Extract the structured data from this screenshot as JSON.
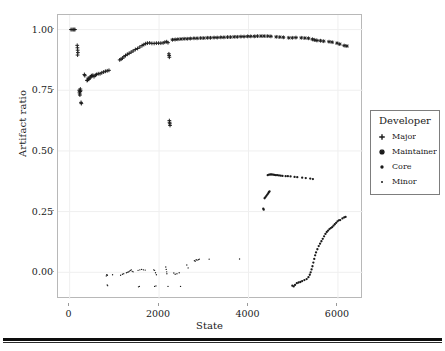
{
  "chart_data": {
    "type": "scatter",
    "title": "",
    "xlabel": "State",
    "ylabel": "Artifact ratio",
    "xlim": [
      -260,
      6560
    ],
    "ylim": [
      -0.11,
      1.06
    ],
    "xticks": [
      0,
      2000,
      4000,
      6000
    ],
    "xtick_labels": [
      "0",
      "2000",
      "4000",
      "6000"
    ],
    "yticks": [
      0.0,
      0.25,
      0.5,
      0.75,
      1.0
    ],
    "ytick_labels": [
      "0.00",
      "0.25",
      "0.50",
      "0.75",
      "1.00"
    ],
    "grid": true,
    "grid_color": "#efefef",
    "legend_position": "right",
    "marker_color": "#1a1a1a",
    "series": [
      {
        "name": "Major",
        "marker": "plus",
        "points": [
          [
            30,
            1.0
          ],
          [
            55,
            1.0
          ],
          [
            80,
            1.0
          ],
          [
            100,
            1.0
          ],
          [
            120,
            1.0
          ],
          [
            170,
            0.935
          ],
          [
            175,
            0.925
          ],
          [
            180,
            0.915
          ],
          [
            185,
            0.905
          ],
          [
            178,
            0.895
          ],
          [
            215,
            0.75
          ],
          [
            220,
            0.742
          ],
          [
            225,
            0.735
          ],
          [
            230,
            0.73
          ],
          [
            235,
            0.745
          ],
          [
            240,
            0.755
          ],
          [
            245,
            0.748
          ],
          [
            255,
            0.7
          ],
          [
            262,
            0.695
          ],
          [
            330,
            0.815
          ],
          [
            340,
            0.81
          ],
          [
            390,
            0.79
          ],
          [
            400,
            0.792
          ],
          [
            415,
            0.8
          ],
          [
            430,
            0.795
          ],
          [
            450,
            0.8
          ],
          [
            470,
            0.805
          ],
          [
            485,
            0.81
          ],
          [
            500,
            0.808
          ],
          [
            520,
            0.812
          ],
          [
            545,
            0.806
          ],
          [
            575,
            0.812
          ],
          [
            600,
            0.815
          ],
          [
            640,
            0.818
          ],
          [
            680,
            0.818
          ],
          [
            720,
            0.822
          ],
          [
            760,
            0.825
          ],
          [
            800,
            0.828
          ],
          [
            840,
            0.83
          ],
          [
            880,
            0.832
          ],
          [
            1120,
            0.875
          ],
          [
            1150,
            0.878
          ],
          [
            1180,
            0.882
          ],
          [
            1215,
            0.888
          ],
          [
            1250,
            0.893
          ],
          [
            1290,
            0.898
          ],
          [
            1330,
            0.902
          ],
          [
            1375,
            0.907
          ],
          [
            1420,
            0.912
          ],
          [
            1470,
            0.918
          ],
          [
            1520,
            0.922
          ],
          [
            1570,
            0.928
          ],
          [
            1620,
            0.934
          ],
          [
            1660,
            0.938
          ],
          [
            1700,
            0.942
          ],
          [
            1740,
            0.944
          ],
          [
            1790,
            0.945
          ],
          [
            1840,
            0.943
          ],
          [
            1890,
            0.943
          ],
          [
            1940,
            0.944
          ],
          [
            1990,
            0.944
          ],
          [
            2040,
            0.944
          ],
          [
            2090,
            0.945
          ],
          [
            2130,
            0.948
          ],
          [
            2170,
            0.95
          ],
          [
            2200,
            0.946
          ],
          [
            2220,
            0.9
          ],
          [
            2225,
            0.893
          ],
          [
            2230,
            0.886
          ],
          [
            2230,
            0.625
          ],
          [
            2235,
            0.618
          ],
          [
            2240,
            0.612
          ],
          [
            2245,
            0.605
          ]
        ]
      },
      {
        "name": "Maintainer",
        "marker": "asterisk",
        "points": [
          [
            2300,
            0.958
          ],
          [
            2360,
            0.959
          ],
          [
            2420,
            0.96
          ],
          [
            2490,
            0.961
          ],
          [
            2560,
            0.962
          ],
          [
            2630,
            0.962
          ],
          [
            2700,
            0.963
          ],
          [
            2780,
            0.964
          ],
          [
            2850,
            0.964
          ],
          [
            2930,
            0.965
          ],
          [
            3000,
            0.965
          ],
          [
            3080,
            0.966
          ],
          [
            3150,
            0.966
          ],
          [
            3230,
            0.967
          ],
          [
            3300,
            0.967
          ],
          [
            3380,
            0.968
          ],
          [
            3450,
            0.968
          ],
          [
            3530,
            0.969
          ],
          [
            3600,
            0.969
          ],
          [
            3680,
            0.97
          ],
          [
            3750,
            0.97
          ],
          [
            3830,
            0.971
          ],
          [
            3900,
            0.971
          ],
          [
            3980,
            0.972
          ],
          [
            4050,
            0.972
          ],
          [
            4130,
            0.972
          ],
          [
            4200,
            0.973
          ],
          [
            4280,
            0.973
          ],
          [
            4350,
            0.973
          ],
          [
            4430,
            0.973
          ],
          [
            4500,
            0.972
          ],
          [
            4620,
            0.97
          ],
          [
            4700,
            0.969
          ],
          [
            4780,
            0.968
          ],
          [
            4900,
            0.966
          ],
          [
            4980,
            0.966
          ],
          [
            5060,
            0.967
          ],
          [
            5180,
            0.966
          ],
          [
            5260,
            0.965
          ],
          [
            5340,
            0.964
          ],
          [
            5430,
            0.96
          ],
          [
            5480,
            0.957
          ],
          [
            5530,
            0.955
          ],
          [
            5610,
            0.954
          ],
          [
            5680,
            0.952
          ],
          [
            5800,
            0.95
          ],
          [
            5870,
            0.948
          ],
          [
            5980,
            0.944
          ],
          [
            6040,
            0.94
          ],
          [
            6140,
            0.934
          ],
          [
            6200,
            0.932
          ]
        ]
      },
      {
        "name": "Core",
        "marker": "dot",
        "points": [
          [
            4430,
            0.4
          ],
          [
            4460,
            0.402
          ],
          [
            4490,
            0.403
          ],
          [
            4520,
            0.403
          ],
          [
            4550,
            0.402
          ],
          [
            4580,
            0.401
          ],
          [
            4610,
            0.4
          ],
          [
            4640,
            0.4
          ],
          [
            4680,
            0.399
          ],
          [
            4720,
            0.398
          ],
          [
            4760,
            0.397
          ],
          [
            4830,
            0.396
          ],
          [
            4880,
            0.396
          ],
          [
            4940,
            0.395
          ],
          [
            5030,
            0.393
          ],
          [
            5090,
            0.392
          ],
          [
            5200,
            0.39
          ],
          [
            5280,
            0.388
          ],
          [
            5380,
            0.386
          ],
          [
            5440,
            0.384
          ],
          [
            4360,
            0.305
          ],
          [
            4380,
            0.31
          ],
          [
            4400,
            0.315
          ],
          [
            4420,
            0.32
          ],
          [
            4440,
            0.325
          ],
          [
            4455,
            0.33
          ],
          [
            4470,
            0.333
          ],
          [
            4330,
            0.262
          ],
          [
            4340,
            0.258
          ],
          [
            4980,
            -0.055
          ],
          [
            5010,
            -0.058
          ],
          [
            5040,
            -0.052
          ],
          [
            5080,
            -0.045
          ],
          [
            5120,
            -0.042
          ],
          [
            5160,
            -0.04
          ],
          [
            5200,
            -0.036
          ],
          [
            5250,
            -0.032
          ],
          [
            5300,
            -0.028
          ],
          [
            5340,
            -0.02
          ],
          [
            5370,
            -0.01
          ],
          [
            5390,
            0.0
          ],
          [
            5410,
            0.012
          ],
          [
            5430,
            0.025
          ],
          [
            5450,
            0.04
          ],
          [
            5470,
            0.055
          ],
          [
            5490,
            0.07
          ],
          [
            5510,
            0.082
          ],
          [
            5540,
            0.095
          ],
          [
            5570,
            0.108
          ],
          [
            5600,
            0.118
          ],
          [
            5630,
            0.128
          ],
          [
            5660,
            0.138
          ],
          [
            5690,
            0.148
          ],
          [
            5720,
            0.158
          ],
          [
            5750,
            0.166
          ],
          [
            5780,
            0.172
          ],
          [
            5810,
            0.178
          ],
          [
            5840,
            0.182
          ],
          [
            5870,
            0.186
          ],
          [
            5900,
            0.192
          ],
          [
            5930,
            0.198
          ],
          [
            5960,
            0.204
          ],
          [
            5990,
            0.21
          ],
          [
            6020,
            0.214
          ],
          [
            6050,
            0.215
          ],
          [
            6100,
            0.222
          ],
          [
            6140,
            0.226
          ],
          [
            6170,
            0.228
          ]
        ]
      },
      {
        "name": "Minor",
        "marker": "small-dot",
        "points": [
          [
            820,
            -0.015
          ],
          [
            830,
            -0.01
          ],
          [
            845,
            -0.012
          ],
          [
            840,
            -0.052
          ],
          [
            850,
            -0.055
          ],
          [
            960,
            -0.01
          ],
          [
            1140,
            -0.012
          ],
          [
            1180,
            -0.008
          ],
          [
            1210,
            -0.006
          ],
          [
            1270,
            -0.002
          ],
          [
            1300,
            0.0
          ],
          [
            1320,
            0.002
          ],
          [
            1340,
            0.005
          ],
          [
            1360,
            0.008
          ],
          [
            1380,
            0.01
          ],
          [
            1400,
            0.004
          ],
          [
            1420,
            0.002
          ],
          [
            1530,
            0.008
          ],
          [
            1570,
            0.01
          ],
          [
            1610,
            0.012
          ],
          [
            1650,
            0.01
          ],
          [
            1690,
            0.009
          ],
          [
            1540,
            -0.06
          ],
          [
            1560,
            -0.058
          ],
          [
            1880,
            0.01
          ],
          [
            1900,
            0.008
          ],
          [
            1920,
            -0.002
          ],
          [
            1940,
            -0.01
          ],
          [
            1900,
            -0.058
          ],
          [
            1930,
            -0.056
          ],
          [
            2150,
            0.022
          ],
          [
            2160,
            0.012
          ],
          [
            2170,
            0.002
          ],
          [
            2175,
            -0.006
          ],
          [
            2200,
            -0.058
          ],
          [
            2330,
            -0.003
          ],
          [
            2360,
            -0.008
          ],
          [
            2400,
            -0.006
          ],
          [
            2450,
            -0.002
          ],
          [
            2480,
            -0.058
          ],
          [
            2620,
            0.03
          ],
          [
            2650,
            0.018
          ],
          [
            2790,
            0.048
          ],
          [
            2810,
            0.046
          ],
          [
            2830,
            0.052
          ],
          [
            2850,
            0.05
          ],
          [
            2880,
            0.052
          ],
          [
            2900,
            0.054
          ],
          [
            3120,
            0.054
          ],
          [
            3800,
            0.055
          ]
        ]
      }
    ]
  },
  "axes": {
    "y_title": "Artifact ratio",
    "x_title": "State"
  },
  "legend": {
    "title": "Developer",
    "entries": [
      {
        "label": "Major",
        "marker": "plus-icon"
      },
      {
        "label": "Maintainer",
        "marker": "asterisk-icon"
      },
      {
        "label": "Core",
        "marker": "dot-icon"
      },
      {
        "label": "Minor",
        "marker": "small-dot-icon"
      }
    ]
  }
}
